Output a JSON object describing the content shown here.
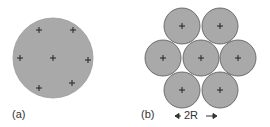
{
  "panels": [
    {
      "label": "(a)",
      "description": "single large circle with 7 charges"
    },
    {
      "label": "(b)",
      "description": "7 close-packed circles"
    }
  ],
  "dimension_label": "2R",
  "colors": {
    "fill": "#a9a9a9",
    "stroke": "#555555",
    "text": "#333333"
  }
}
